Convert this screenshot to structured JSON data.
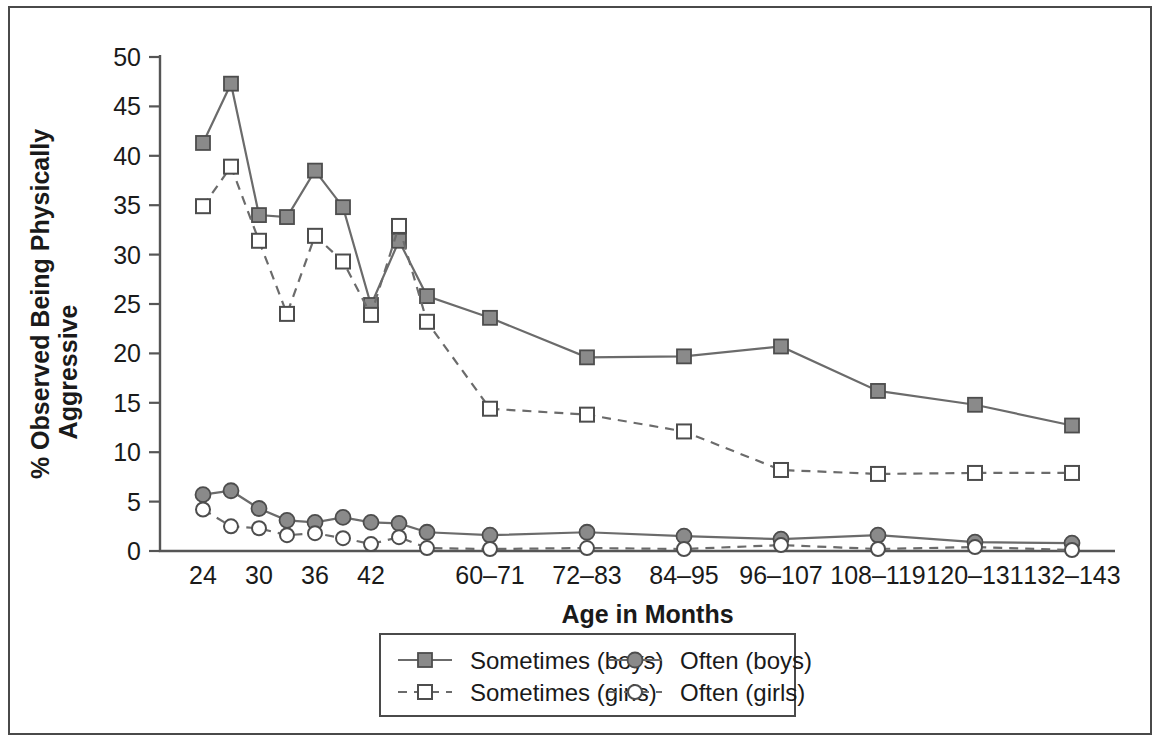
{
  "figure": {
    "frame_color": "#4a4a4a",
    "background": "#ffffff"
  },
  "chart_data": {
    "type": "line",
    "title": "",
    "xlabel": "Age in Months",
    "ylabel": "% Observed Being Physically Aggressive",
    "ylabel_line1": "% Observed Being Physically",
    "ylabel_line2": "Aggressive",
    "ylim": [
      0,
      50
    ],
    "ytick_step": 5,
    "yticks": [
      0,
      5,
      10,
      15,
      20,
      25,
      30,
      35,
      40,
      45,
      50
    ],
    "ytick_labels": [
      "0",
      "5",
      "10",
      "15",
      "20",
      "25",
      "30",
      "35",
      "40",
      "45",
      "50"
    ],
    "grid": false,
    "legend_position": "bottom-center",
    "x_categories": [
      "24",
      "26",
      "30",
      "32",
      "36",
      "38",
      "42",
      "44",
      "48",
      "60–71",
      "72–83",
      "84–95",
      "96–107",
      "108–119",
      "120–131",
      "132–143"
    ],
    "xtick_labels_shown": [
      "24",
      "30",
      "36",
      "42",
      "60–71",
      "72–83",
      "84–95",
      "96–107",
      "108–119",
      "120–131",
      "132–143"
    ],
    "xtick_label_indices": [
      0,
      2,
      4,
      6,
      9,
      10,
      11,
      12,
      13,
      14,
      15
    ],
    "series": [
      {
        "name": "Sometimes (boys)",
        "style": "solid",
        "marker": "filled-square",
        "color": "#8a8a8a",
        "values": [
          41.3,
          47.3,
          34.0,
          33.8,
          38.5,
          34.8,
          24.9,
          31.4,
          25.8,
          23.6,
          19.6,
          19.7,
          20.7,
          16.2,
          14.8,
          12.7
        ]
      },
      {
        "name": "Sometimes (girls)",
        "style": "dashed",
        "marker": "open-square",
        "color": "#ffffff",
        "values": [
          34.9,
          38.9,
          31.4,
          24.0,
          31.9,
          29.3,
          23.9,
          32.9,
          23.2,
          14.4,
          13.8,
          12.1,
          8.2,
          7.8,
          7.9,
          7.9
        ]
      },
      {
        "name": "Often (boys)",
        "style": "solid",
        "marker": "filled-circle",
        "color": "#8a8a8a",
        "values": [
          5.7,
          6.1,
          4.3,
          3.1,
          2.9,
          3.4,
          2.9,
          2.8,
          1.9,
          1.6,
          1.9,
          1.5,
          1.2,
          1.6,
          0.9,
          0.8
        ]
      },
      {
        "name": "Often (girls)",
        "style": "dashed",
        "marker": "open-circle",
        "color": "#ffffff",
        "values": [
          4.2,
          2.5,
          2.3,
          1.6,
          1.8,
          1.3,
          0.7,
          1.4,
          0.3,
          0.2,
          0.3,
          0.2,
          0.6,
          0.2,
          0.4,
          0.1
        ]
      }
    ]
  },
  "legend": {
    "entries": [
      {
        "label": "Sometimes (boys)",
        "style": "solid",
        "marker": "filled-square"
      },
      {
        "label": "Often (boys)",
        "style": "solid",
        "marker": "filled-circle"
      },
      {
        "label": "Sometimes (girls)",
        "style": "dashed",
        "marker": "open-square"
      },
      {
        "label": "Often (girls)",
        "style": "dashed",
        "marker": "open-circle"
      }
    ]
  }
}
